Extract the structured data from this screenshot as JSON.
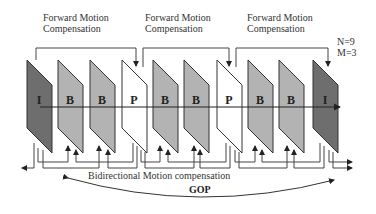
{
  "diagram": {
    "labels": {
      "fwd1": [
        "Forward Motion",
        "Compensation"
      ],
      "fwd2": [
        "Forward Motion",
        "Compensation"
      ],
      "fwd3": [
        "Forward Motion",
        "Compensation"
      ],
      "n": "N=9",
      "m": "M=3",
      "bidirectional": "Bidirectional Motion compensation",
      "gop": "GOP"
    },
    "frames": [
      {
        "type": "I",
        "x": 27,
        "fill": "#6e6e6e"
      },
      {
        "type": "B",
        "x": 58,
        "fill": "#b3b3b3"
      },
      {
        "type": "B",
        "x": 90,
        "fill": "#b3b3b3"
      },
      {
        "type": "P",
        "x": 122,
        "fill": "#ffffff"
      },
      {
        "type": "B",
        "x": 153,
        "fill": "#b3b3b3"
      },
      {
        "type": "B",
        "x": 184,
        "fill": "#b3b3b3"
      },
      {
        "type": "P",
        "x": 217,
        "fill": "#ffffff"
      },
      {
        "type": "B",
        "x": 248,
        "fill": "#b3b3b3"
      },
      {
        "type": "B",
        "x": 279,
        "fill": "#b3b3b3"
      },
      {
        "type": "I",
        "x": 313,
        "fill": "#6e6e6e"
      }
    ],
    "colors": {
      "line": "#333333",
      "i_frame": "#6e6e6e",
      "b_frame": "#b3b3b3",
      "p_frame": "#ffffff"
    }
  }
}
